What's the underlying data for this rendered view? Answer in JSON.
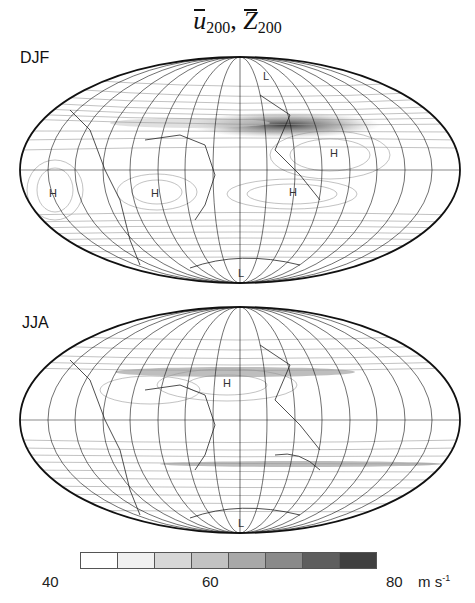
{
  "figure": {
    "title_vars": [
      "u",
      "Z"
    ],
    "title_sub": "200",
    "title_sep": ","
  },
  "panels": [
    {
      "label": "DJF",
      "markers": [
        {
          "text": "L",
          "x": 263,
          "y": 80
        },
        {
          "text": "H",
          "x": 330,
          "y": 157
        },
        {
          "text": "H",
          "x": 292,
          "y": 196
        },
        {
          "text": "H",
          "x": 53,
          "y": 197
        },
        {
          "text": "H",
          "x": 155,
          "y": 197
        },
        {
          "text": "L",
          "x": 242,
          "y": 277
        }
      ]
    },
    {
      "label": "JJA",
      "markers": [
        {
          "text": "H",
          "x": 227,
          "y": 387
        },
        {
          "text": "L",
          "x": 242,
          "y": 527
        }
      ]
    }
  ],
  "colorbar": {
    "colors": [
      "#ffffff",
      "#f0f0f0",
      "#d7d7d7",
      "#c2c2c2",
      "#a8a8a8",
      "#8a8a8a",
      "#5e5e5e",
      "#404040"
    ],
    "ticks": [
      {
        "label": "40",
        "x": 88
      },
      {
        "label": "60",
        "x": 210
      },
      {
        "label": "80",
        "x": 350
      }
    ],
    "unit": "m s",
    "unit_exp": "-1"
  }
}
